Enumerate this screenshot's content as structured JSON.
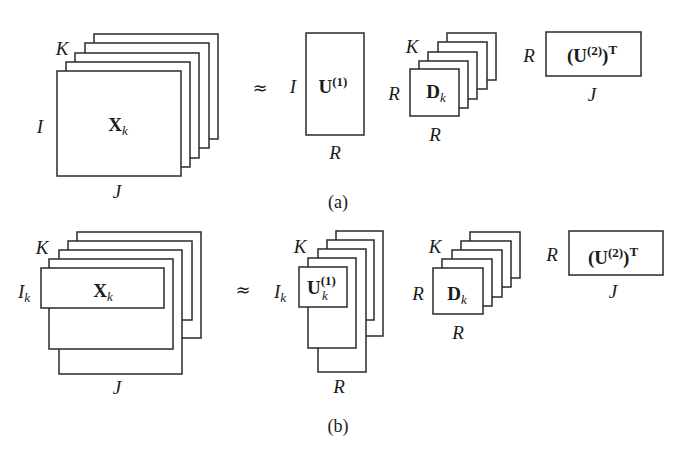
{
  "panel_a": {
    "caption": "(a)",
    "tensor": {
      "symbol": "X",
      "sub": "k",
      "stack_label": "K",
      "row_label": "I",
      "col_label": "J"
    },
    "approx_sign": "≈",
    "u1": {
      "symbol": "U",
      "sup": "(1)",
      "row_label": "I",
      "col_label": "R"
    },
    "d": {
      "symbol": "D",
      "sub": "k",
      "stack_label": "K",
      "row_label": "R",
      "col_label": "R"
    },
    "u2t": {
      "open": "(",
      "symbol": "U",
      "sup": "(2)",
      "close": ")",
      "transpose": "T",
      "row_label": "R",
      "col_label": "J"
    }
  },
  "panel_b": {
    "caption": "(b)",
    "tensor": {
      "symbol": "X",
      "sub": "k",
      "stack_label": "K",
      "row_label": "I",
      "row_sub": "k",
      "col_label": "J"
    },
    "approx_sign": "≈",
    "u1": {
      "symbol": "U",
      "sub": "k",
      "sup": "(1)",
      "stack_label": "K",
      "row_label": "I",
      "row_sub": "k",
      "col_label": "R"
    },
    "d": {
      "symbol": "D",
      "sub": "k",
      "stack_label": "K",
      "row_label": "R",
      "col_label": "R"
    },
    "u2t": {
      "open": "(",
      "symbol": "U",
      "sup": "(2)",
      "close": ")",
      "transpose": "T",
      "row_label": "R",
      "col_label": "J"
    }
  }
}
